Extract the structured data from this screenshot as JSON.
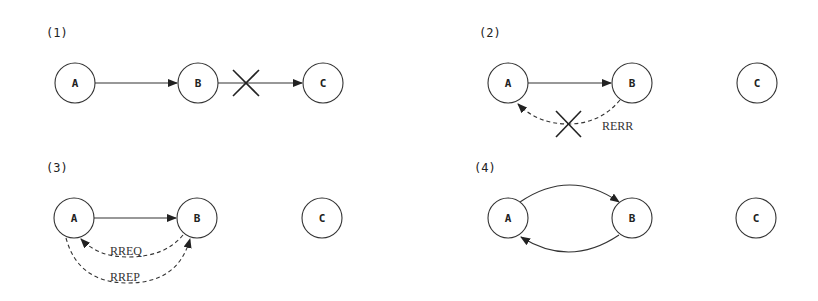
{
  "diagram": {
    "panels": [
      {
        "label": "(1)",
        "nodes": [
          {
            "id": "A",
            "label": "A"
          },
          {
            "id": "B",
            "label": "B"
          },
          {
            "id": "C",
            "label": "C"
          }
        ],
        "edges": [
          {
            "from": "A",
            "to": "B",
            "style": "solid"
          },
          {
            "from": "B",
            "to": "C",
            "style": "solid",
            "broken": true
          }
        ]
      },
      {
        "label": "(2)",
        "nodes": [
          {
            "id": "A",
            "label": "A"
          },
          {
            "id": "B",
            "label": "B"
          },
          {
            "id": "C",
            "label": "C"
          }
        ],
        "edges": [
          {
            "from": "A",
            "to": "B",
            "style": "solid"
          },
          {
            "from": "B",
            "to": "A",
            "style": "dashed",
            "label": "RERR",
            "broken": true
          }
        ]
      },
      {
        "label": "(3)",
        "nodes": [
          {
            "id": "A",
            "label": "A"
          },
          {
            "id": "B",
            "label": "B"
          },
          {
            "id": "C",
            "label": "C"
          }
        ],
        "edges": [
          {
            "from": "A",
            "to": "B",
            "style": "solid"
          },
          {
            "from": "B",
            "to": "A",
            "style": "dashed",
            "label": "RREQ"
          },
          {
            "from": "A",
            "to": "B",
            "style": "dashed",
            "label": "RREP"
          }
        ]
      },
      {
        "label": "(4)",
        "nodes": [
          {
            "id": "A",
            "label": "A"
          },
          {
            "id": "B",
            "label": "B"
          },
          {
            "id": "C",
            "label": "C"
          }
        ],
        "edges": [
          {
            "from": "A",
            "to": "B",
            "style": "solid",
            "curve": "upper"
          },
          {
            "from": "B",
            "to": "A",
            "style": "solid",
            "curve": "lower"
          }
        ]
      }
    ]
  }
}
